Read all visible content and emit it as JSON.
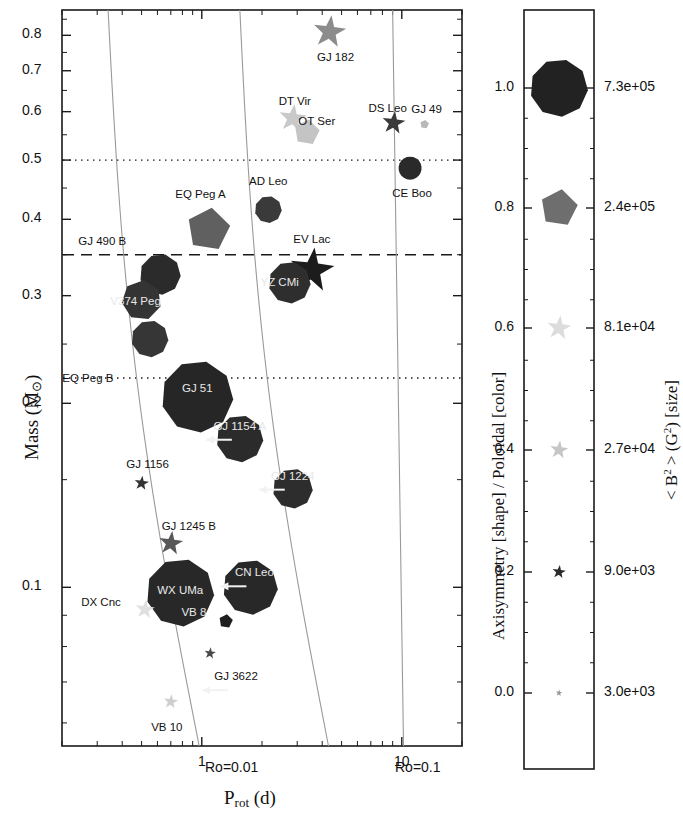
{
  "figure": {
    "type": "scatter",
    "width": 683,
    "height": 825,
    "background": "#ffffff",
    "ink": "#1a1a1a"
  },
  "main_panel": {
    "frame": {
      "left": 62,
      "right": 462,
      "top": 10,
      "bottom": 746
    },
    "xaxis": {
      "label": "P",
      "label_sub": "rot",
      "label_unit": "(d)",
      "scale": "log",
      "range": [
        0.2,
        20.0
      ],
      "major_ticks": [
        {
          "value": 1,
          "label": "1"
        },
        {
          "value": 10,
          "label": "10"
        }
      ]
    },
    "yaxis": {
      "label": "Mass (M",
      "label_sub": "⊙",
      "label_close": ")",
      "scale": "log",
      "range": [
        0.055,
        0.88
      ],
      "major_ticks": [
        {
          "value": 0.8,
          "label": "0.8"
        },
        {
          "value": 0.7,
          "label": "0.7"
        },
        {
          "value": 0.6,
          "label": "0.6"
        },
        {
          "value": 0.5,
          "label": "0.5"
        },
        {
          "value": 0.4,
          "label": "0.4"
        },
        {
          "value": 0.3,
          "label": "0.3"
        },
        {
          "value": 0.2,
          "label": "0.2"
        },
        {
          "value": 0.1,
          "label": "0.1"
        }
      ]
    },
    "hlines": [
      {
        "value": 0.5,
        "style": "dotted"
      },
      {
        "value": 0.35,
        "style": "dashed"
      },
      {
        "value": 0.22,
        "style": "dotted"
      }
    ],
    "rossby_curves": [
      {
        "label": "Ro=0.01",
        "label_x": 205,
        "label_y": 760
      },
      {
        "label": "Ro=0.1",
        "label_x": 395,
        "label_y": 760
      }
    ]
  },
  "chart_data": {
    "type": "scatter",
    "title": "",
    "xlabel": "P_rot (d)",
    "ylabel": "Mass (M_sun)",
    "xscale": "log",
    "yscale": "log",
    "xlim": [
      0.2,
      20.0
    ],
    "ylim": [
      0.055,
      0.88
    ],
    "grid": false,
    "encodings": {
      "shape": "Axisymmetry",
      "color": "Poloidal fraction",
      "size": "<B^2> (G^2)"
    },
    "points": [
      {
        "name": "GJ 182",
        "prot": 4.35,
        "mass": 0.81,
        "shape": "star",
        "gray": "#8c8c8c",
        "size": 34,
        "label_dx": 6,
        "label_dy": 26,
        "label_color": "dark"
      },
      {
        "name": "DT Vir",
        "prot": 2.85,
        "mass": 0.585,
        "shape": "star",
        "gray": "#c9c9c9",
        "size": 29,
        "label_dx": 2,
        "label_dy": -16,
        "label_color": "dark"
      },
      {
        "name": "OT Ser",
        "prot": 3.35,
        "mass": 0.555,
        "shape": "pentagon",
        "gray": "#c4c4c4",
        "size": 26,
        "label_dx": 10,
        "label_dy": -10,
        "label_color": "dark"
      },
      {
        "name": "DS Leo",
        "prot": 9.1,
        "mass": 0.575,
        "shape": "star",
        "gray": "#3a3a3a",
        "size": 24,
        "label_dx": -6,
        "label_dy": -14,
        "label_color": "dark"
      },
      {
        "name": "GJ 49",
        "prot": 13.0,
        "mass": 0.572,
        "shape": "pentagon",
        "gray": "#b8b8b8",
        "size": 9,
        "label_dx": 2,
        "label_dy": -14,
        "label_color": "dark"
      },
      {
        "name": "CE Boo",
        "prot": 11.0,
        "mass": 0.485,
        "shape": "circle",
        "gray": "#2a2a2a",
        "size": 23,
        "label_dx": 2,
        "label_dy": 26,
        "label_color": "dark"
      },
      {
        "name": "AD Leo",
        "prot": 2.15,
        "mass": 0.415,
        "shape": "nonagon",
        "gray": "#3a3a3a",
        "size": 27,
        "label_dx": 0,
        "label_dy": -28,
        "label_color": "dark"
      },
      {
        "name": "EQ Peg A",
        "prot": 1.08,
        "mass": 0.385,
        "shape": "pentagon",
        "gray": "#606060",
        "size": 44,
        "label_dx": -8,
        "label_dy": -34,
        "label_color": "dark"
      },
      {
        "name": "GJ 490 B",
        "prot": 0.62,
        "mass": 0.325,
        "shape": "nonagon",
        "gray": "#2b2b2b",
        "size": 41,
        "label_dx": -58,
        "label_dy": -32,
        "label_color": "dark"
      },
      {
        "name": "V374 Peg",
        "prot": 0.5,
        "mass": 0.295,
        "shape": "heptagon",
        "gray": "#343434",
        "size": 40,
        "label_dx": -6,
        "label_dy": 2,
        "label_color": "light"
      },
      {
        "name": "EQ Peg B",
        "prot": 0.55,
        "mass": 0.255,
        "shape": "nonagon",
        "gray": "#363636",
        "size": 37,
        "label_dx": -62,
        "label_dy": 40,
        "label_color": "dark"
      },
      {
        "name": "YZ CMi",
        "prot": 2.75,
        "mass": 0.315,
        "shape": "nonagon",
        "gray": "#2e2e2e",
        "size": 42,
        "label_dx": -10,
        "label_dy": 0,
        "label_color": "light"
      },
      {
        "name": "EV Lac",
        "prot": 3.55,
        "mass": 0.33,
        "shape": "star",
        "gray": "#1c1c1c",
        "size": 46,
        "label_dx": 0,
        "label_dy": -30,
        "label_color": "dark"
      },
      {
        "name": "GJ 51",
        "prot": 0.95,
        "mass": 0.205,
        "shape": "nonagon",
        "gray": "#262626",
        "size": 72,
        "label_dx": 0,
        "label_dy": -8,
        "label_color": "light"
      },
      {
        "name": "GJ 1154 A",
        "prot": 1.55,
        "mass": 0.175,
        "shape": "nonagon",
        "gray": "#2b2b2b",
        "size": 47,
        "label_dx": 0,
        "label_dy": -12,
        "label_color": "light",
        "arrow": "left"
      },
      {
        "name": "GJ 1224",
        "prot": 2.85,
        "mass": 0.145,
        "shape": "nonagon",
        "gray": "#2d2d2d",
        "size": 40,
        "label_dx": 0,
        "label_dy": -12,
        "label_color": "light",
        "arrow": "left"
      },
      {
        "name": "GJ 1156",
        "prot": 0.5,
        "mass": 0.148,
        "shape": "star",
        "gray": "#333333",
        "size": 15,
        "label_dx": 6,
        "label_dy": -18,
        "label_color": "dark"
      },
      {
        "name": "GJ 1245 B",
        "prot": 0.7,
        "mass": 0.118,
        "shape": "star",
        "gray": "#585858",
        "size": 25,
        "label_dx": 18,
        "label_dy": -16,
        "label_color": "dark"
      },
      {
        "name": "WX UMa",
        "prot": 0.78,
        "mass": 0.098,
        "shape": "nonagon",
        "gray": "#282828",
        "size": 68,
        "label_dx": 0,
        "label_dy": -2,
        "label_color": "light"
      },
      {
        "name": "CN Leo",
        "prot": 1.75,
        "mass": 0.1,
        "shape": "nonagon",
        "gray": "#282828",
        "size": 55,
        "label_dx": 4,
        "label_dy": -14,
        "label_color": "light",
        "arrow": "left"
      },
      {
        "name": "DX Cnc",
        "prot": 0.52,
        "mass": 0.092,
        "shape": "star",
        "gray": "#e0e0e0",
        "size": 20,
        "label_dx": -44,
        "label_dy": -6,
        "label_color": "dark"
      },
      {
        "name": "VB 8",
        "prot": 1.32,
        "mass": 0.088,
        "shape": "pentagon",
        "gray": "#1f1f1f",
        "size": 14,
        "label_dx": -32,
        "label_dy": -8,
        "label_color": "light"
      },
      {
        "name": "GJ 3622",
        "prot": 1.1,
        "mass": 0.078,
        "shape": "star",
        "gray": "#4a4a4a",
        "size": 12,
        "label_dx": 26,
        "label_dy": 24,
        "label_color": "dark",
        "arrow": "left"
      },
      {
        "name": "VB 10",
        "prot": 0.7,
        "mass": 0.065,
        "shape": "star",
        "gray": "#cfcfcf",
        "size": 15,
        "label_dx": -4,
        "label_dy": 26,
        "label_color": "dark"
      }
    ]
  },
  "legend_panel": {
    "frame": {
      "left": 524,
      "right": 594,
      "top": 10,
      "bottom": 769
    },
    "left_axis_label": "Axisymmetry [shape] / Poloidal [color]",
    "right_axis_label_parts": {
      "lt": "<",
      "b": "B",
      "sup": "2",
      "gt": ">",
      "unit": "(G",
      "unit_sup": "2",
      "unit_close": ")",
      "tag": "[size]"
    },
    "entries": [
      {
        "axisym": "1.0",
        "field": "7.3e+05",
        "y": 88,
        "shape": "nonagon",
        "gray": "#222222",
        "size": 58
      },
      {
        "axisym": "0.8",
        "field": "2.4e+05",
        "y": 208,
        "shape": "pentagon",
        "gray": "#6e6e6e",
        "size": 38
      },
      {
        "axisym": "0.6",
        "field": "8.1e+04",
        "y": 328,
        "shape": "star",
        "gray": "#dcdcdc",
        "size": 25
      },
      {
        "axisym": "0.4",
        "field": "2.7e+04",
        "y": 450,
        "shape": "star",
        "gray": "#c6c6c6",
        "size": 19
      },
      {
        "axisym": "0.2",
        "field": "9.0e+03",
        "y": 572,
        "shape": "star",
        "gray": "#2a2a2a",
        "size": 14
      },
      {
        "axisym": "0.0",
        "field": "3.0e+03",
        "y": 693,
        "shape": "star",
        "gray": "#999999",
        "size": 7
      }
    ]
  }
}
